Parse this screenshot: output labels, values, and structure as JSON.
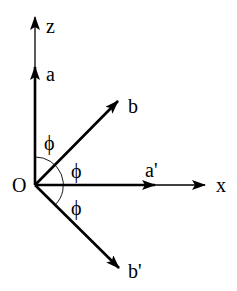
{
  "diagram": {
    "origin_label": "O",
    "axes": {
      "z_label": "z",
      "x_label": "x"
    },
    "vectors": {
      "a": "a",
      "b": "b",
      "a_prime": "a'",
      "b_prime": "b'"
    },
    "angles": {
      "phi_1": "ϕ",
      "phi_2": "ϕ",
      "phi_3": "ϕ"
    },
    "colors": {
      "line": "#000000",
      "background": "#ffffff"
    }
  }
}
